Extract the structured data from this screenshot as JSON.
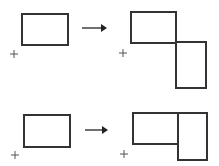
{
  "colors": {
    "stroke": "#333333",
    "background": "#ffffff"
  },
  "rows": [
    {
      "name": "row-1",
      "before": {
        "rectangles": 1,
        "orientation": "landscape",
        "origin_marker": "plus"
      },
      "arrow": "right-arrow",
      "after": {
        "rectangles": 2,
        "arrangement": "second rectangle rotated 90° and attached below-right at corner",
        "origin_marker": "plus"
      }
    },
    {
      "name": "row-2",
      "before": {
        "rectangles": 1,
        "orientation": "landscape",
        "origin_marker": "plus"
      },
      "arrow": "right-arrow",
      "after": {
        "rectangles": 2,
        "arrangement": "second rectangle rotated 90° and attached to the right, top-aligned",
        "origin_marker": "plus"
      }
    }
  ]
}
